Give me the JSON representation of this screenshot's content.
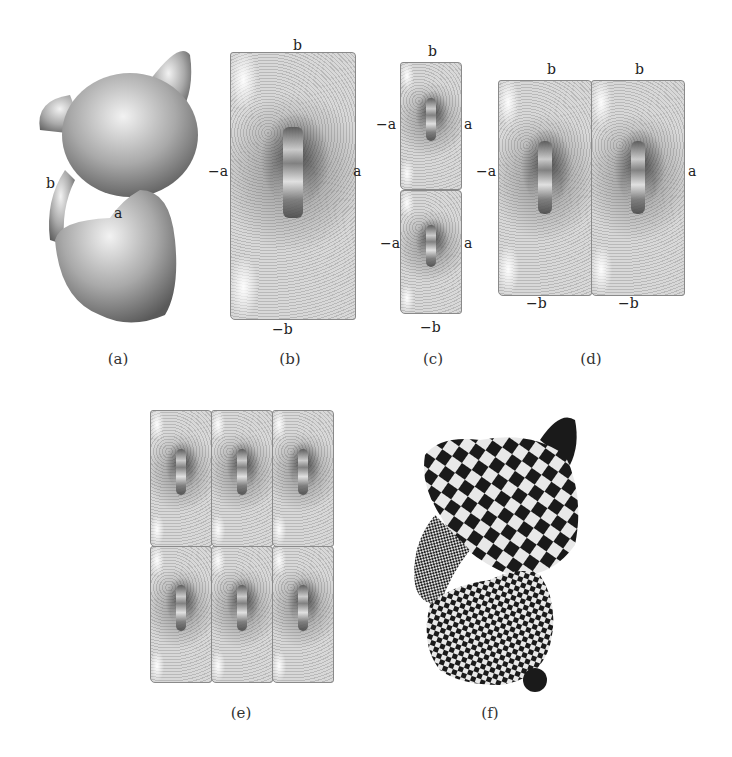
{
  "figure": {
    "panels": [
      {
        "id": "a",
        "caption": "(a)",
        "description": "Shaded 3D kitten mesh with cut points marked",
        "labels": [
          "b",
          "a"
        ]
      },
      {
        "id": "b",
        "caption": "(b)",
        "description": "Single parameterization tile with boundary identifications",
        "labels": {
          "top": "b",
          "bottom": "−b",
          "left": "−a",
          "right": "a"
        }
      },
      {
        "id": "c",
        "caption": "(c)",
        "description": "Two tiles stacked vertically",
        "labels": {
          "top": "b",
          "bottom": "−b",
          "left_upper": "−a",
          "right_upper": "a",
          "left_lower": "−a",
          "right_lower": "a"
        }
      },
      {
        "id": "d",
        "caption": "(d)",
        "description": "Two tiles side by side",
        "labels": {
          "top_left": "b",
          "top_right": "b",
          "bottom_left": "−b",
          "bottom_right": "−b",
          "left": "−a",
          "right": "a"
        }
      },
      {
        "id": "e",
        "caption": "(e)",
        "description": "3×2 tiling of the parameterization"
      },
      {
        "id": "f",
        "caption": "(f)",
        "description": "Kitten mesh textured with checkerboard"
      }
    ]
  },
  "text": {
    "a_b": "b",
    "a_a": "a",
    "b_top": "b",
    "b_bottom": "−b",
    "b_left": "−a",
    "b_right": "a",
    "c_top": "b",
    "c_bottom": "−b",
    "c_left1": "−a",
    "c_right1": "a",
    "c_left2": "−a",
    "c_right2": "a",
    "d_top1": "b",
    "d_top2": "b",
    "d_bottom1": "−b",
    "d_bottom2": "−b",
    "d_left": "−a",
    "d_right": "a",
    "cap_a": "(a)",
    "cap_b": "(b)",
    "cap_c": "(c)",
    "cap_d": "(d)",
    "cap_e": "(e)",
    "cap_f": "(f)"
  },
  "colors": {
    "background": "#ffffff",
    "mesh_gray": "#cfcfcf",
    "checker_dark": "#1a1a1a",
    "checker_light": "#e8e8e8"
  }
}
